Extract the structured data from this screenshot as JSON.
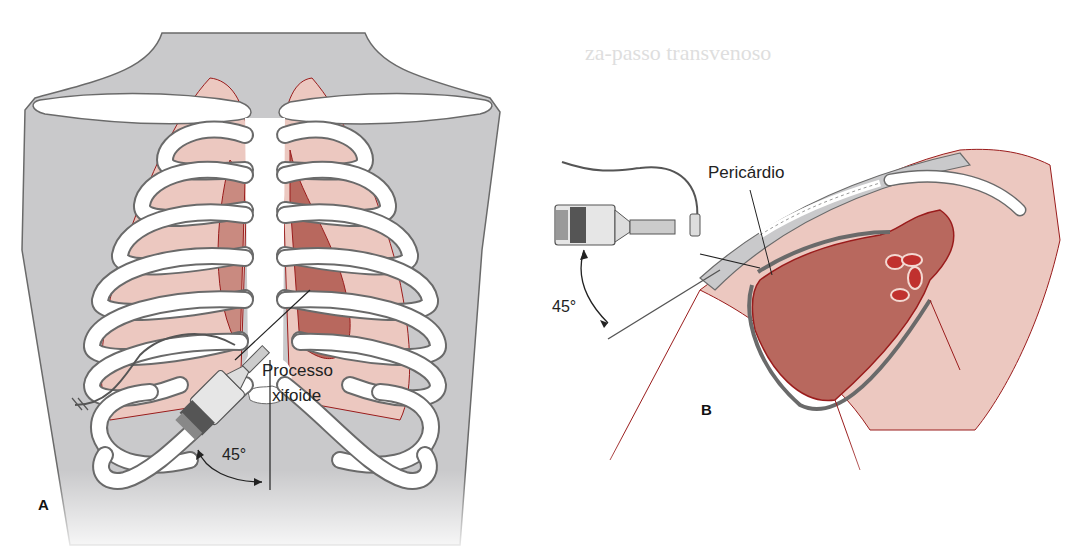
{
  "figure": {
    "type": "medical-illustration",
    "colors": {
      "skin_gray": "#c9c9cb",
      "bone": "#ffffff",
      "bone_outline": "#6a6a6a",
      "lung_pink": "#ecc8c0",
      "heart_dark": "#b8685e",
      "heart_mid": "#c98a80",
      "vessel_red": "#9a1c1c",
      "text": "#222222"
    },
    "panels": [
      {
        "id": "A",
        "letter": "A",
        "view": "anterior thorax",
        "labels": {
          "landmark": "Processo",
          "landmark_line2": "xifoide",
          "angle": "45°"
        }
      },
      {
        "id": "B",
        "letter": "B",
        "view": "sagittal section",
        "labels": {
          "structure": "Pericárdio",
          "angle": "45°"
        }
      }
    ],
    "bleed_through_text": {
      "heading": "za-passo transvenoso",
      "caption_fragment": "Pericardiocentese"
    }
  }
}
